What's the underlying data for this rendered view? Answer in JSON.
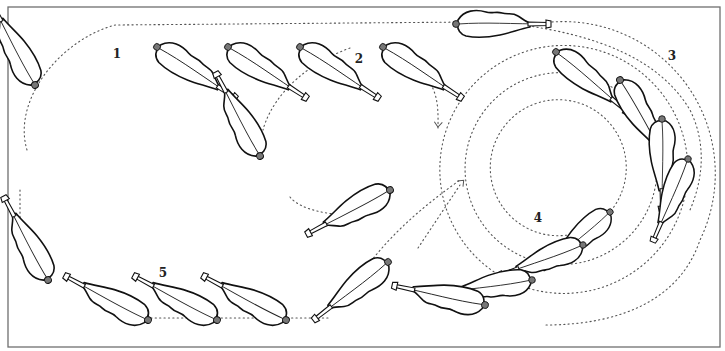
{
  "diagram": {
    "title": "",
    "colors": {
      "ink": "#111111",
      "dots": "#555555",
      "frame": "#6f6f6f",
      "background": "#ffffff"
    },
    "frame": {
      "x": 8,
      "y": 7,
      "width": 712,
      "height": 340
    },
    "labels": [
      {
        "id": "1",
        "text": "1",
        "x": 117,
        "y": 58
      },
      {
        "id": "2",
        "text": "2",
        "x": 359,
        "y": 63
      },
      {
        "id": "3",
        "text": "3",
        "x": 672,
        "y": 60
      },
      {
        "id": "4",
        "text": "4",
        "x": 538,
        "y": 222
      },
      {
        "id": "5",
        "text": "5",
        "x": 163,
        "y": 277
      }
    ],
    "feathers": [
      {
        "stage": "1",
        "x": 35,
        "y": 85,
        "angle": -118,
        "scale": 1.0
      },
      {
        "stage": "1",
        "x": 157,
        "y": 47,
        "angle": 33,
        "scale": 1.0
      },
      {
        "stage": "1",
        "x": 228,
        "y": 47,
        "angle": 33,
        "scale": 1.0
      },
      {
        "stage": "2",
        "x": 300,
        "y": 47,
        "angle": 33,
        "scale": 1.0
      },
      {
        "stage": "2",
        "x": 383,
        "y": 47,
        "angle": 33,
        "scale": 1.0
      },
      {
        "stage": "2",
        "x": 456,
        "y": 24,
        "angle": 0,
        "scale": 1.0
      },
      {
        "stage": "2",
        "x": 260,
        "y": 156,
        "angle": -118,
        "scale": 1.0
      },
      {
        "stage": "2",
        "x": 390,
        "y": 190,
        "angle": 152,
        "scale": 1.0
      },
      {
        "stage": "3",
        "x": 556,
        "y": 52,
        "angle": 40,
        "scale": 1.0
      },
      {
        "stage": "3",
        "x": 620,
        "y": 80,
        "angle": 60,
        "scale": 1.0
      },
      {
        "stage": "3",
        "x": 662,
        "y": 119,
        "angle": 90,
        "scale": 0.97
      },
      {
        "stage": "3",
        "x": 688,
        "y": 159,
        "angle": 113,
        "scale": 0.95
      },
      {
        "stage": "4",
        "x": 610,
        "y": 212,
        "angle": 140,
        "scale": 0.93
      },
      {
        "stage": "4",
        "x": 583,
        "y": 245,
        "angle": 160,
        "scale": 0.95
      },
      {
        "stage": "4",
        "x": 532,
        "y": 280,
        "angle": 172,
        "scale": 0.97
      },
      {
        "stage": "4",
        "x": 485,
        "y": 305,
        "angle": -168,
        "scale": 1.0
      },
      {
        "stage": "4",
        "x": 388,
        "y": 262,
        "angle": 142,
        "scale": 1.0
      },
      {
        "stage": "5",
        "x": 48,
        "y": 280,
        "angle": -118,
        "scale": 1.0
      },
      {
        "stage": "5",
        "x": 148,
        "y": 320,
        "angle": -152,
        "scale": 1.0
      },
      {
        "stage": "5",
        "x": 217,
        "y": 320,
        "angle": -152,
        "scale": 1.0
      },
      {
        "stage": "5",
        "x": 286,
        "y": 320,
        "angle": -152,
        "scale": 1.0
      }
    ],
    "paths": [
      {
        "name": "loop-1-outer",
        "d": "M 27 150 C 12 100 60 40 115 25 L 470 22"
      },
      {
        "name": "loop-2",
        "d": "M 350 48 C 290 70 268 110 263 130"
      },
      {
        "name": "loop-2-down",
        "d": "M 420 70 C 440 90 438 110 438 130"
      },
      {
        "name": "loop-2-bottom",
        "d": "M 290 197 C 300 210 330 215 352 215"
      },
      {
        "name": "stage-3-arc",
        "d": "M 515 24 C 600 35 660 60 690 110 C 705 140 705 175 690 210"
      },
      {
        "name": "ring-1",
        "d": "M 552 100 A 68 68 0 1 1 551 100.1"
      },
      {
        "name": "ring-2",
        "d": "M 552 73 A 96 96 0 1 1 551 73.1"
      },
      {
        "name": "ring-3",
        "d": "M 552 46 A 124 124 0 1 1 551 46.1"
      },
      {
        "name": "ring-4",
        "d": "M 552 22 A 152 152 0 0 1 700 240 C 680 300 620 325 545 325"
      },
      {
        "name": "crossing",
        "d": "M 418 248 L 460 185"
      },
      {
        "name": "loop-5-left",
        "d": "M 20 190 L 20 225"
      },
      {
        "name": "loop-5-bottom",
        "d": "M 120 318 L 330 318"
      },
      {
        "name": "return-to-4",
        "d": "M 368 265 C 395 230 425 205 460 180"
      }
    ],
    "arrows": [
      {
        "name": "arrow-2-up",
        "x": 257,
        "y": 138,
        "angle": -80
      },
      {
        "name": "arrow-2-down",
        "x": 438,
        "y": 126,
        "angle": 95
      },
      {
        "name": "arrow-2-left",
        "x": 347,
        "y": 215,
        "angle": 180
      },
      {
        "name": "arrow-crossing",
        "x": 463,
        "y": 181,
        "angle": -45
      }
    ]
  }
}
